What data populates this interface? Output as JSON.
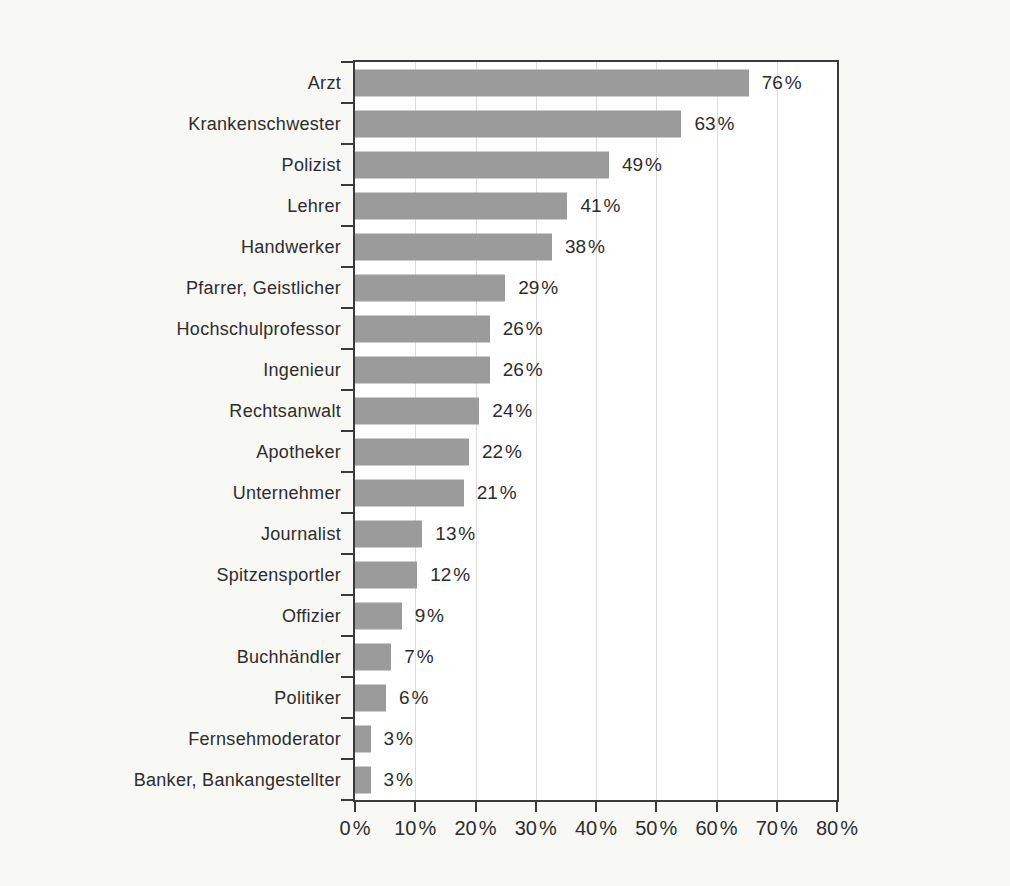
{
  "chart_data": {
    "type": "bar",
    "orientation": "horizontal",
    "title": "",
    "xlabel": "",
    "ylabel": "",
    "categories": [
      "Arzt",
      "Krankenschwester",
      "Polizist",
      "Lehrer",
      "Handwerker",
      "Pfarrer, Geistlicher",
      "Hochschulprofessor",
      "Ingenieur",
      "Rechtsanwalt",
      "Apotheker",
      "Unternehmer",
      "Journalist",
      "Spitzensportler",
      "Offizier",
      "Buchhändler",
      "Politiker",
      "Fernsehmoderator",
      "Banker, Bankangestellter"
    ],
    "values": [
      76,
      63,
      49,
      41,
      38,
      29,
      26,
      26,
      24,
      22,
      21,
      13,
      12,
      9,
      7,
      6,
      3,
      3
    ],
    "value_labels": [
      "76 %",
      "63 %",
      "49 %",
      "41 %",
      "38 %",
      "29 %",
      "26 %",
      "26 %",
      "24 %",
      "22 %",
      "21 %",
      "13 %",
      "12 %",
      "9 %",
      "7 %",
      "6 %",
      "3 %",
      "3 %"
    ],
    "xlim": [
      0,
      80
    ],
    "x_ticks": [
      0,
      10,
      20,
      30,
      40,
      50,
      60,
      70,
      80
    ],
    "x_tick_labels": [
      "0 %",
      "10 %",
      "20 %",
      "30 %",
      "40 %",
      "50 %",
      "60 %",
      "70 %",
      "80 %"
    ],
    "grid": "vertical",
    "legend": "none",
    "bar_color": "#9b9b9b",
    "bar_render_scale": 0.86
  },
  "colors": {
    "page_bg": "#f8f8f5",
    "plot_bg": "#ffffff",
    "frame": "#3a3a3a",
    "gridline": "#dcdcda",
    "text": "#2d2d2d"
  }
}
